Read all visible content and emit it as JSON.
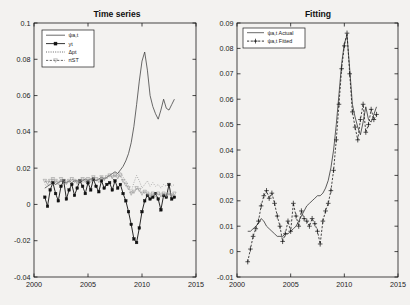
{
  "figure": {
    "background_color": "#f3f2f0",
    "axis_color": "#1a1a1a"
  },
  "panels": [
    {
      "id": "time-series",
      "title": "Time series",
      "ylim": [
        -0.04,
        0.1
      ],
      "yticks": [
        "0.1",
        "0.08",
        "0.06",
        "0.04",
        "0.02",
        "0",
        "-0.02",
        "-0.04"
      ],
      "ytick_values": [
        0.1,
        0.08,
        0.06,
        0.04,
        0.02,
        0,
        -0.02,
        -0.04
      ],
      "xlim": [
        2000,
        2015
      ],
      "xticks": [
        "2000",
        "2005",
        "2010",
        "2015"
      ],
      "xtick_values": [
        2000,
        2005,
        2010,
        2015
      ],
      "legend": [
        {
          "label": "ψa,t",
          "style": "solid-thin",
          "marker": "none"
        },
        {
          "label": "yt",
          "style": "solid-thick",
          "marker": "square"
        },
        {
          "label": "Δpt",
          "style": "dotted",
          "marker": "none"
        },
        {
          "label": "rtST",
          "style": "dashed",
          "marker": "triangle"
        }
      ]
    },
    {
      "id": "fitting",
      "title": "Fitting",
      "ylim": [
        -0.01,
        0.09
      ],
      "yticks": [
        "0.09",
        "0.08",
        "0.07",
        "0.06",
        "0.05",
        "0.04",
        "0.03",
        "0.02",
        "0.01",
        "0",
        "-0.01"
      ],
      "ytick_values": [
        0.09,
        0.08,
        0.07,
        0.06,
        0.05,
        0.04,
        0.03,
        0.02,
        0.01,
        0,
        -0.01
      ],
      "xlim": [
        2000,
        2015
      ],
      "xticks": [
        "2000",
        "2005",
        "2010",
        "2015"
      ],
      "xtick_values": [
        2000,
        2005,
        2010,
        2015
      ],
      "legend": [
        {
          "label": "ψa,t Actual",
          "style": "solid",
          "marker": "none"
        },
        {
          "label": "ψa,t Fitted",
          "style": "dashed",
          "marker": "plus"
        }
      ]
    }
  ],
  "chart_data": [
    {
      "type": "line",
      "title": "Time series",
      "xlabel": "",
      "ylabel": "",
      "xlim": [
        2000,
        2015
      ],
      "ylim": [
        -0.04,
        0.1
      ],
      "grid": false,
      "legend_position": "upper-left",
      "x": [
        2001.0,
        2001.25,
        2001.5,
        2001.75,
        2002.0,
        2002.25,
        2002.5,
        2002.75,
        2003.0,
        2003.25,
        2003.5,
        2003.75,
        2004.0,
        2004.25,
        2004.5,
        2004.75,
        2005.0,
        2005.25,
        2005.5,
        2005.75,
        2006.0,
        2006.25,
        2006.5,
        2006.75,
        2007.0,
        2007.25,
        2007.5,
        2007.75,
        2008.0,
        2008.25,
        2008.5,
        2008.75,
        2009.0,
        2009.25,
        2009.5,
        2009.75,
        2010.0,
        2010.25,
        2010.5,
        2010.75,
        2011.0,
        2011.25,
        2011.5,
        2011.75,
        2012.0,
        2012.25,
        2012.5,
        2012.75,
        2013.0
      ],
      "series": [
        {
          "name": "ψa,t",
          "values": [
            0.009,
            0.01,
            0.011,
            0.012,
            0.011,
            0.012,
            0.013,
            0.012,
            0.012,
            0.013,
            0.012,
            0.013,
            0.013,
            0.012,
            0.013,
            0.014,
            0.013,
            0.014,
            0.014,
            0.013,
            0.014,
            0.015,
            0.014,
            0.015,
            0.016,
            0.017,
            0.018,
            0.017,
            0.019,
            0.021,
            0.024,
            0.028,
            0.034,
            0.043,
            0.055,
            0.068,
            0.079,
            0.084,
            0.074,
            0.06,
            0.054,
            0.05,
            0.047,
            0.052,
            0.058,
            0.053,
            0.052,
            0.055,
            0.058
          ]
        },
        {
          "name": "yt",
          "values": [
            0.004,
            -0.001,
            0.008,
            0.012,
            0.006,
            0.002,
            0.01,
            0.013,
            0.003,
            0.008,
            0.011,
            0.005,
            0.009,
            0.013,
            0.01,
            0.006,
            0.012,
            0.008,
            0.014,
            0.01,
            0.007,
            0.013,
            0.009,
            0.011,
            0.012,
            0.008,
            0.013,
            0.009,
            0.011,
            0.006,
            0.002,
            -0.004,
            -0.011,
            -0.019,
            -0.021,
            -0.013,
            -0.004,
            0.002,
            0.005,
            0.003,
            0.004,
            0.006,
            0.003,
            -0.003,
            0.005,
            0.004,
            0.011,
            0.003,
            0.004
          ]
        },
        {
          "name": "Δpt",
          "values": [
            0.011,
            0.01,
            0.012,
            0.011,
            0.012,
            0.011,
            0.013,
            0.012,
            0.011,
            0.013,
            0.012,
            0.013,
            0.012,
            0.013,
            0.012,
            0.013,
            0.014,
            0.013,
            0.014,
            0.013,
            0.014,
            0.015,
            0.014,
            0.015,
            0.016,
            0.015,
            0.017,
            0.016,
            0.018,
            0.015,
            0.013,
            0.01,
            0.007,
            0.012,
            0.016,
            0.013,
            0.009,
            0.011,
            0.013,
            0.01,
            0.012,
            0.01,
            0.011,
            0.009,
            0.011,
            0.01,
            0.012,
            0.01,
            0.011
          ]
        },
        {
          "name": "rtST",
          "values": [
            0.013,
            0.012,
            0.013,
            0.014,
            0.013,
            0.012,
            0.014,
            0.013,
            0.012,
            0.013,
            0.014,
            0.013,
            0.012,
            0.013,
            0.014,
            0.013,
            0.014,
            0.013,
            0.015,
            0.014,
            0.013,
            0.015,
            0.014,
            0.015,
            0.016,
            0.015,
            0.016,
            0.015,
            0.016,
            0.013,
            0.011,
            0.009,
            0.006,
            0.007,
            0.009,
            0.008,
            0.006,
            0.007,
            0.006,
            0.005,
            0.006,
            0.005,
            0.006,
            0.005,
            0.006,
            0.005,
            0.006,
            0.005,
            0.006
          ]
        }
      ]
    },
    {
      "type": "line",
      "title": "Fitting",
      "xlabel": "",
      "ylabel": "",
      "xlim": [
        2000,
        2015
      ],
      "ylim": [
        -0.01,
        0.09
      ],
      "grid": false,
      "legend_position": "upper-left",
      "x": [
        2001.0,
        2001.25,
        2001.5,
        2001.75,
        2002.0,
        2002.25,
        2002.5,
        2002.75,
        2003.0,
        2003.25,
        2003.5,
        2003.75,
        2004.0,
        2004.25,
        2004.5,
        2004.75,
        2005.0,
        2005.25,
        2005.5,
        2005.75,
        2006.0,
        2006.25,
        2006.5,
        2006.75,
        2007.0,
        2007.25,
        2007.5,
        2007.75,
        2008.0,
        2008.25,
        2008.5,
        2008.75,
        2009.0,
        2009.25,
        2009.5,
        2009.75,
        2010.0,
        2010.25,
        2010.5,
        2010.75,
        2011.0,
        2011.25,
        2011.5,
        2011.75,
        2012.0,
        2012.25,
        2012.5,
        2012.75,
        2013.0
      ],
      "series": [
        {
          "name": "ψa,t Actual",
          "values": [
            0.008,
            0.008,
            0.009,
            0.01,
            0.011,
            0.013,
            0.012,
            0.01,
            0.009,
            0.008,
            0.007,
            0.006,
            0.006,
            0.006,
            0.007,
            0.007,
            0.008,
            0.009,
            0.01,
            0.012,
            0.014,
            0.016,
            0.018,
            0.019,
            0.02,
            0.021,
            0.022,
            0.022,
            0.023,
            0.025,
            0.028,
            0.033,
            0.04,
            0.05,
            0.062,
            0.074,
            0.082,
            0.085,
            0.072,
            0.058,
            0.053,
            0.049,
            0.046,
            0.051,
            0.057,
            0.052,
            0.051,
            0.054,
            0.057
          ]
        },
        {
          "name": "ψa,t Fitted",
          "values": [
            -0.004,
            0.001,
            0.006,
            0.009,
            0.012,
            0.018,
            0.022,
            0.024,
            0.021,
            0.023,
            0.019,
            0.014,
            0.01,
            0.004,
            0.007,
            0.012,
            0.008,
            0.019,
            0.014,
            0.01,
            0.016,
            0.013,
            0.012,
            0.01,
            0.013,
            0.011,
            0.008,
            0.003,
            0.012,
            0.016,
            0.019,
            0.024,
            0.032,
            0.044,
            0.058,
            0.072,
            0.081,
            0.086,
            0.07,
            0.055,
            0.049,
            0.044,
            0.052,
            0.058,
            0.047,
            0.05,
            0.056,
            0.052,
            0.054
          ]
        }
      ]
    }
  ]
}
